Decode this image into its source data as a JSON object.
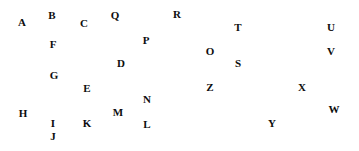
{
  "scene": {
    "title": "scattered-alphabet-letters",
    "width": 359,
    "height": 151,
    "background_color": "#ffffff",
    "text_color": "#0d0d0d",
    "font_size_px": 11,
    "font_weight": "bold",
    "letter_count": 26
  },
  "letters": [
    {
      "char": "A",
      "x": 22,
      "y": 22
    },
    {
      "char": "B",
      "x": 52,
      "y": 15
    },
    {
      "char": "C",
      "x": 84,
      "y": 23
    },
    {
      "char": "D",
      "x": 121,
      "y": 63
    },
    {
      "char": "E",
      "x": 87,
      "y": 88
    },
    {
      "char": "F",
      "x": 53,
      "y": 44
    },
    {
      "char": "G",
      "x": 54,
      "y": 75
    },
    {
      "char": "H",
      "x": 23,
      "y": 113
    },
    {
      "char": "I",
      "x": 53,
      "y": 123
    },
    {
      "char": "J",
      "x": 53,
      "y": 136
    },
    {
      "char": "K",
      "x": 87,
      "y": 123
    },
    {
      "char": "L",
      "x": 147,
      "y": 124
    },
    {
      "char": "M",
      "x": 118,
      "y": 112
    },
    {
      "char": "N",
      "x": 147,
      "y": 99
    },
    {
      "char": "O",
      "x": 210,
      "y": 51
    },
    {
      "char": "P",
      "x": 146,
      "y": 40
    },
    {
      "char": "Q",
      "x": 115,
      "y": 15
    },
    {
      "char": "R",
      "x": 177,
      "y": 14
    },
    {
      "char": "S",
      "x": 238,
      "y": 63
    },
    {
      "char": "T",
      "x": 238,
      "y": 27
    },
    {
      "char": "U",
      "x": 331,
      "y": 27
    },
    {
      "char": "V",
      "x": 331,
      "y": 51
    },
    {
      "char": "W",
      "x": 334,
      "y": 109
    },
    {
      "char": "X",
      "x": 302,
      "y": 87
    },
    {
      "char": "Y",
      "x": 272,
      "y": 123
    },
    {
      "char": "Z",
      "x": 210,
      "y": 87
    }
  ]
}
